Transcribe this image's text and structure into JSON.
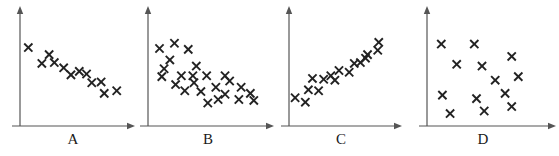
{
  "figure": {
    "title": "",
    "background_color": "#ffffff",
    "marker_color": "#222222",
    "axis_color": "#555555",
    "label_color": "#1a1a1a",
    "marker_glyph": "x-cross-marker"
  },
  "chart_data": [
    {
      "type": "scatter",
      "title": "A",
      "xlabel": "A",
      "ylabel": "",
      "xlim": [
        0,
        100
      ],
      "ylim": [
        0,
        100
      ],
      "grid": false,
      "legend": "none",
      "axes": "arrow-axes",
      "n_points": 12,
      "relationship": "strong negative",
      "points": [
        {
          "x": 8,
          "y": 80
        },
        {
          "x": 28,
          "y": 72
        },
        {
          "x": 21,
          "y": 62
        },
        {
          "x": 33,
          "y": 63
        },
        {
          "x": 42,
          "y": 57
        },
        {
          "x": 49,
          "y": 49
        },
        {
          "x": 64,
          "y": 50
        },
        {
          "x": 69,
          "y": 40
        },
        {
          "x": 78,
          "y": 41
        },
        {
          "x": 81,
          "y": 28
        },
        {
          "x": 93,
          "y": 31
        },
        {
          "x": 57,
          "y": 53
        }
      ]
    },
    {
      "type": "scatter",
      "title": "B",
      "xlabel": "B",
      "ylabel": "",
      "xlim": [
        0,
        100
      ],
      "ylim": [
        0,
        100
      ],
      "grid": false,
      "legend": "none",
      "axes": "arrow-axes",
      "n_points": 24,
      "relationship": "weak negative",
      "points": [
        {
          "x": 10,
          "y": 79
        },
        {
          "x": 23,
          "y": 85
        },
        {
          "x": 35,
          "y": 78
        },
        {
          "x": 19,
          "y": 66
        },
        {
          "x": 14,
          "y": 56
        },
        {
          "x": 42,
          "y": 59
        },
        {
          "x": 12,
          "y": 47
        },
        {
          "x": 29,
          "y": 48
        },
        {
          "x": 39,
          "y": 48
        },
        {
          "x": 51,
          "y": 48
        },
        {
          "x": 67,
          "y": 48
        },
        {
          "x": 40,
          "y": 40
        },
        {
          "x": 32,
          "y": 31
        },
        {
          "x": 46,
          "y": 30
        },
        {
          "x": 59,
          "y": 35
        },
        {
          "x": 81,
          "y": 35
        },
        {
          "x": 67,
          "y": 27
        },
        {
          "x": 89,
          "y": 28
        },
        {
          "x": 61,
          "y": 21
        },
        {
          "x": 79,
          "y": 21
        },
        {
          "x": 52,
          "y": 17
        },
        {
          "x": 24,
          "y": 38
        },
        {
          "x": 71,
          "y": 42
        },
        {
          "x": 92,
          "y": 20
        }
      ]
    },
    {
      "type": "scatter",
      "title": "C",
      "xlabel": "C",
      "ylabel": "",
      "xlim": [
        0,
        100
      ],
      "ylim": [
        0,
        100
      ],
      "grid": false,
      "legend": "none",
      "axes": "arrow-axes",
      "n_points": 16,
      "relationship": "strong positive",
      "points": [
        {
          "x": 6,
          "y": 23
        },
        {
          "x": 16,
          "y": 18
        },
        {
          "x": 19,
          "y": 32
        },
        {
          "x": 29,
          "y": 31
        },
        {
          "x": 23,
          "y": 45
        },
        {
          "x": 34,
          "y": 44
        },
        {
          "x": 45,
          "y": 43
        },
        {
          "x": 49,
          "y": 54
        },
        {
          "x": 59,
          "y": 52
        },
        {
          "x": 64,
          "y": 62
        },
        {
          "x": 70,
          "y": 63
        },
        {
          "x": 77,
          "y": 72
        },
        {
          "x": 87,
          "y": 77
        },
        {
          "x": 88,
          "y": 86
        },
        {
          "x": 41,
          "y": 48
        },
        {
          "x": 75,
          "y": 68
        }
      ]
    },
    {
      "type": "scatter",
      "title": "D",
      "xlabel": "D",
      "ylabel": "",
      "xlim": [
        0,
        100
      ],
      "ylim": [
        0,
        100
      ],
      "grid": false,
      "legend": "none",
      "axes": "arrow-axes",
      "n_points": 13,
      "relationship": "no correlation",
      "points": [
        {
          "x": 13,
          "y": 84
        },
        {
          "x": 43,
          "y": 84
        },
        {
          "x": 77,
          "y": 70
        },
        {
          "x": 27,
          "y": 61
        },
        {
          "x": 50,
          "y": 59
        },
        {
          "x": 83,
          "y": 47
        },
        {
          "x": 62,
          "y": 43
        },
        {
          "x": 14,
          "y": 26
        },
        {
          "x": 45,
          "y": 22
        },
        {
          "x": 71,
          "y": 28
        },
        {
          "x": 21,
          "y": 5
        },
        {
          "x": 52,
          "y": 8
        },
        {
          "x": 77,
          "y": 13
        }
      ]
    }
  ],
  "panels": [
    {
      "id": "panel-a",
      "label": "A",
      "left": 0,
      "width": 140,
      "origin_x": 20,
      "baseline_y": 126,
      "axis_top_y": 10,
      "axis_right_x": 132,
      "plot_w": 104,
      "plot_h": 104,
      "label_x": 53,
      "label_y": 132
    },
    {
      "id": "panel-b",
      "label": "B",
      "left": 140,
      "width": 137,
      "origin_x": 8,
      "baseline_y": 126,
      "axis_top_y": 10,
      "axis_right_x": 131,
      "plot_w": 115,
      "plot_h": 104,
      "label_x": 48,
      "label_y": 132
    },
    {
      "id": "panel-c",
      "label": "C",
      "left": 277,
      "width": 128,
      "origin_x": 12,
      "baseline_y": 126,
      "axis_top_y": 10,
      "axis_right_x": 122,
      "plot_w": 102,
      "plot_h": 104,
      "label_x": 44,
      "label_y": 132
    },
    {
      "id": "panel-d",
      "label": "D",
      "left": 405,
      "width": 154,
      "origin_x": 22,
      "baseline_y": 126,
      "axis_top_y": 10,
      "axis_right_x": 148,
      "plot_w": 110,
      "plot_h": 104,
      "label_x": 58,
      "label_y": 132
    }
  ]
}
